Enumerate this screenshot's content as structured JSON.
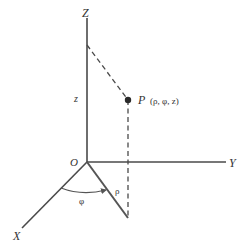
{
  "diagram": {
    "type": "cylindrical-coordinates",
    "colors": {
      "line": "#4a4a4a",
      "text": "#333333",
      "background": "#ffffff"
    },
    "axes": {
      "z_label": "Z",
      "y_label": "Y",
      "x_label": "X",
      "origin_label": "O"
    },
    "point": {
      "name": "P",
      "coords": "(ρ, φ, z)"
    },
    "labels": {
      "z_height": "z",
      "rho": "ρ",
      "phi": "φ"
    }
  }
}
